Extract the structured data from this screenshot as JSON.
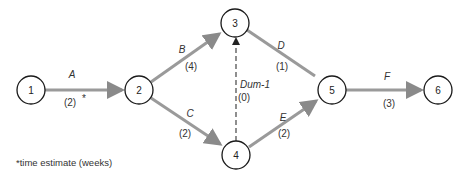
{
  "diagram": {
    "type": "activity-on-arrow network",
    "nodes": [
      {
        "id": "1",
        "label": "1",
        "x": 31,
        "y": 90
      },
      {
        "id": "2",
        "label": "2",
        "x": 139,
        "y": 90
      },
      {
        "id": "3",
        "label": "3",
        "x": 235,
        "y": 23
      },
      {
        "id": "4",
        "label": "4",
        "x": 236,
        "y": 155
      },
      {
        "id": "5",
        "label": "5",
        "x": 332,
        "y": 90
      },
      {
        "id": "6",
        "label": "6",
        "x": 438,
        "y": 90
      }
    ],
    "edges": [
      {
        "id": "A",
        "from": "1",
        "to": "2",
        "activity": "A",
        "duration": "(2)",
        "duration_marker": "*",
        "dummy": false
      },
      {
        "id": "B",
        "from": "2",
        "to": "3",
        "activity": "B",
        "duration": "(4)",
        "dummy": false
      },
      {
        "id": "C",
        "from": "2",
        "to": "4",
        "activity": "C",
        "duration": "(2)",
        "dummy": false
      },
      {
        "id": "Dum-1",
        "from": "4",
        "to": "3",
        "activity": "Dum-1",
        "duration": "(0)",
        "dummy": true
      },
      {
        "id": "D",
        "from": "3",
        "to": "5",
        "activity": "D",
        "duration": "(1)",
        "dummy": false
      },
      {
        "id": "E",
        "from": "4",
        "to": "5",
        "activity": "E",
        "duration": "(2)",
        "dummy": false
      },
      {
        "id": "F",
        "from": "5",
        "to": "6",
        "activity": "F",
        "duration": "(3)",
        "dummy": false
      }
    ],
    "footnote": "*time estimate (weeks)",
    "colors": {
      "edge": "#9a9a9a",
      "node_stroke": "#1a1a1a",
      "dummy_edge": "#333333"
    }
  }
}
